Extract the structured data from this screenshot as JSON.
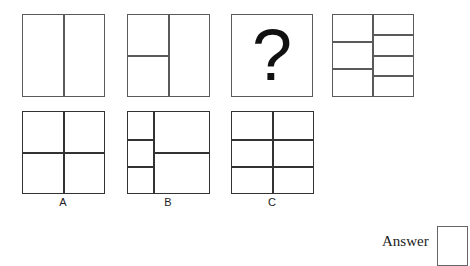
{
  "question": {
    "sequence": [
      {
        "id": "fig1",
        "desc": "square split by one vertical line into 2 halves"
      },
      {
        "id": "fig2",
        "desc": "square split vertically; left half split into 2"
      },
      {
        "id": "fig3",
        "symbol": "?"
      },
      {
        "id": "fig4",
        "desc": "square split vertically; left half split into 3, right half into 4"
      }
    ]
  },
  "options": [
    {
      "label": "A",
      "desc": "2x2 grid"
    },
    {
      "label": "B",
      "desc": "narrow left column split into 3, right column split into 2"
    },
    {
      "label": "C",
      "desc": "2 columns x 3 rows grid"
    }
  ],
  "answer": {
    "label": "Answer",
    "value": ""
  }
}
